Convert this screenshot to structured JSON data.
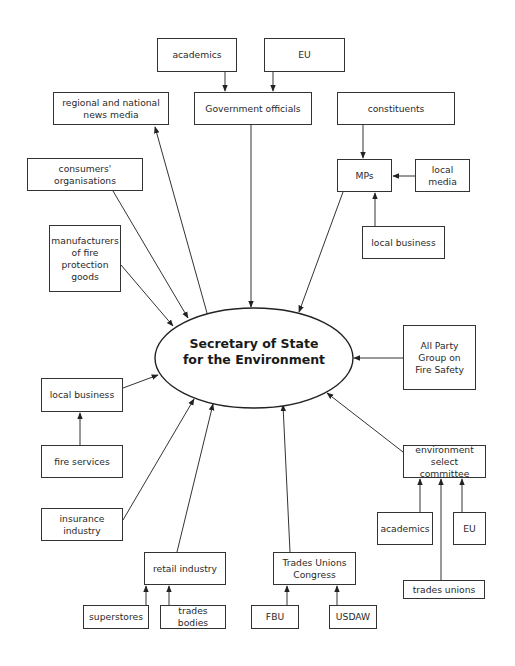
{
  "diagram": {
    "center": {
      "label": "Secretary of State\nfor the Environment",
      "cx": 254,
      "cy": 358,
      "rx": 99,
      "ry": 50
    },
    "nodes": [
      {
        "id": "academics-top",
        "label": "academics",
        "x": 157,
        "y": 38,
        "w": 80,
        "h": 34
      },
      {
        "id": "eu-top",
        "label": "EU",
        "x": 264,
        "y": 38,
        "w": 81,
        "h": 34
      },
      {
        "id": "regional-national-news-media",
        "label": "regional and national\nnews media",
        "x": 53,
        "y": 92,
        "w": 116,
        "h": 33
      },
      {
        "id": "government-officials",
        "label": "Government officials",
        "x": 194,
        "y": 92,
        "w": 118,
        "h": 33
      },
      {
        "id": "constituents",
        "label": "constituents",
        "x": 337,
        "y": 92,
        "w": 118,
        "h": 33
      },
      {
        "id": "consumers-organisations",
        "label": "consumers' organisations",
        "x": 27,
        "y": 158,
        "w": 116,
        "h": 33
      },
      {
        "id": "mps",
        "label": "MPs",
        "x": 337,
        "y": 159,
        "w": 55,
        "h": 33
      },
      {
        "id": "local-media",
        "label": "local media",
        "x": 415,
        "y": 159,
        "w": 55,
        "h": 33
      },
      {
        "id": "local-business-right",
        "label": "local business",
        "x": 362,
        "y": 226,
        "w": 83,
        "h": 33
      },
      {
        "id": "manufacturers-fire-protection",
        "label": "manufacturers\nof fire\nprotection\ngoods",
        "x": 49,
        "y": 225,
        "w": 72,
        "h": 67
      },
      {
        "id": "all-party-group",
        "label": "All Party\nGroup on\nFire Safety",
        "x": 403,
        "y": 325,
        "w": 73,
        "h": 65
      },
      {
        "id": "local-business-left",
        "label": "local business",
        "x": 41,
        "y": 378,
        "w": 82,
        "h": 34
      },
      {
        "id": "fire-services",
        "label": "fire services",
        "x": 41,
        "y": 445,
        "w": 82,
        "h": 33
      },
      {
        "id": "environment-select-committee",
        "label": "environment\nselect committee",
        "x": 403,
        "y": 445,
        "w": 83,
        "h": 33
      },
      {
        "id": "insurance-industry",
        "label": "insurance industry",
        "x": 41,
        "y": 508,
        "w": 82,
        "h": 33
      },
      {
        "id": "academics-right",
        "label": "academics",
        "x": 377,
        "y": 512,
        "w": 56,
        "h": 33
      },
      {
        "id": "eu-right",
        "label": "EU",
        "x": 453,
        "y": 512,
        "w": 33,
        "h": 33
      },
      {
        "id": "retail-industry",
        "label": "retail industry",
        "x": 144,
        "y": 552,
        "w": 82,
        "h": 33
      },
      {
        "id": "trades-unions-congress",
        "label": "Trades Unions\nCongress",
        "x": 273,
        "y": 552,
        "w": 83,
        "h": 33
      },
      {
        "id": "trades-unions",
        "label": "trades unions",
        "x": 403,
        "y": 580,
        "w": 82,
        "h": 19
      },
      {
        "id": "superstores",
        "label": "superstores",
        "x": 83,
        "y": 605,
        "w": 66,
        "h": 24
      },
      {
        "id": "trades-bodies",
        "label": "trades bodies",
        "x": 160,
        "y": 605,
        "w": 66,
        "h": 24
      },
      {
        "id": "fbu",
        "label": "FBU",
        "x": 251,
        "y": 605,
        "w": 48,
        "h": 24
      },
      {
        "id": "usdaw",
        "label": "USDAW",
        "x": 329,
        "y": 605,
        "w": 48,
        "h": 24
      }
    ],
    "edges": [
      {
        "from": "academics-top",
        "to": "government-officials",
        "x1": 225,
        "y1": 72,
        "x2": 225,
        "y2": 91
      },
      {
        "from": "eu-top",
        "to": "government-officials",
        "x1": 273,
        "y1": 72,
        "x2": 273,
        "y2": 91
      },
      {
        "from": "constituents",
        "to": "mps",
        "x1": 363,
        "y1": 125,
        "x2": 363,
        "y2": 158
      },
      {
        "from": "local-media",
        "to": "mps",
        "x1": 415,
        "y1": 176,
        "x2": 393,
        "y2": 176
      },
      {
        "from": "local-business-right",
        "to": "mps",
        "x1": 375,
        "y1": 226,
        "x2": 375,
        "y2": 193
      },
      {
        "from": "mps",
        "to": "secretary-of-state",
        "x1": 343,
        "y1": 192,
        "x2": 299,
        "y2": 312
      },
      {
        "from": "government-officials",
        "to": "secretary-of-state",
        "x1": 251,
        "y1": 125,
        "x2": 251,
        "y2": 307
      },
      {
        "from": "secretary-of-state",
        "to": "regional-national-news-media",
        "x1": 207,
        "y1": 313,
        "x2": 155,
        "y2": 127
      },
      {
        "from": "consumers-organisations",
        "to": "secretary-of-state",
        "x1": 113,
        "y1": 191,
        "x2": 188,
        "y2": 318
      },
      {
        "from": "manufacturers-fire-protection",
        "to": "secretary-of-state",
        "x1": 121,
        "y1": 265,
        "x2": 173,
        "y2": 326
      },
      {
        "from": "all-party-group",
        "to": "secretary-of-state",
        "x1": 403,
        "y1": 358,
        "x2": 354,
        "y2": 358
      },
      {
        "from": "local-business-left",
        "to": "secretary-of-state",
        "x1": 123,
        "y1": 388,
        "x2": 158,
        "y2": 375
      },
      {
        "from": "fire-services",
        "to": "local-business-left",
        "x1": 80,
        "y1": 445,
        "x2": 80,
        "y2": 413
      },
      {
        "from": "insurance-industry",
        "to": "secretary-of-state",
        "x1": 123,
        "y1": 520,
        "x2": 194,
        "y2": 399
      },
      {
        "from": "retail-industry",
        "to": "secretary-of-state",
        "x1": 177,
        "y1": 552,
        "x2": 213,
        "y2": 404
      },
      {
        "from": "trades-unions-congress",
        "to": "secretary-of-state",
        "x1": 290,
        "y1": 552,
        "x2": 283,
        "y2": 405
      },
      {
        "from": "environment-select-committee",
        "to": "secretary-of-state",
        "x1": 403,
        "y1": 452,
        "x2": 327,
        "y2": 393
      },
      {
        "from": "academics-right",
        "to": "environment-select-committee",
        "x1": 420,
        "y1": 512,
        "x2": 420,
        "y2": 479
      },
      {
        "from": "eu-right",
        "to": "environment-select-committee",
        "x1": 462,
        "y1": 512,
        "x2": 462,
        "y2": 479
      },
      {
        "from": "trades-unions",
        "to": "environment-select-committee",
        "x1": 441,
        "y1": 580,
        "x2": 441,
        "y2": 479
      },
      {
        "from": "superstores",
        "to": "retail-industry",
        "x1": 146,
        "y1": 605,
        "x2": 146,
        "y2": 586
      },
      {
        "from": "trades-bodies",
        "to": "retail-industry",
        "x1": 169,
        "y1": 605,
        "x2": 169,
        "y2": 586
      },
      {
        "from": "fbu",
        "to": "trades-unions-congress",
        "x1": 287,
        "y1": 605,
        "x2": 287,
        "y2": 586
      },
      {
        "from": "usdaw",
        "to": "trades-unions-congress",
        "x1": 337,
        "y1": 605,
        "x2": 337,
        "y2": 586
      }
    ],
    "colors": {
      "line": "#333333",
      "text": "#2a2a2a",
      "background": "#ffffff"
    }
  }
}
